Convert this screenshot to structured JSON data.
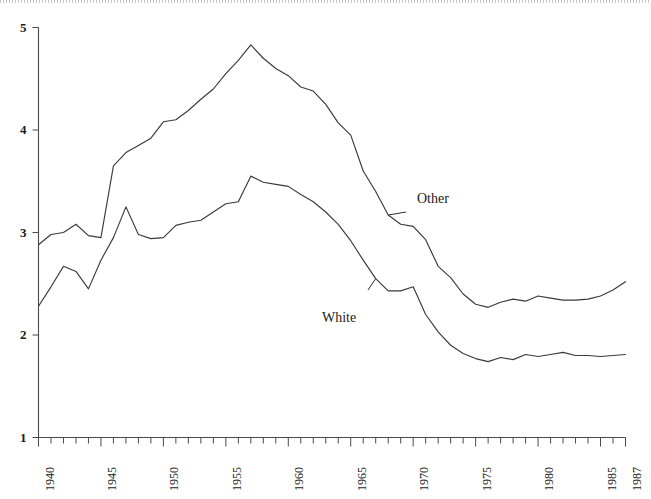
{
  "figure": {
    "background_color": "#ffffff",
    "ink_color": "#3a3a3a",
    "scan_edge_present": true
  },
  "chart_data": {
    "type": "line",
    "title": "",
    "subtitle": "",
    "xlabel": "",
    "ylabel": "",
    "xlim": [
      1940,
      1987
    ],
    "ylim": [
      1,
      5
    ],
    "grid": false,
    "legend_position": "inline-annotations",
    "x_tick_labels": [
      "1940",
      "1945",
      "1950",
      "1955",
      "1960",
      "1965",
      "1970",
      "1975",
      "1980",
      "1985",
      "1987"
    ],
    "x_tick_values": [
      1940,
      1945,
      1950,
      1955,
      1960,
      1965,
      1970,
      1975,
      1980,
      1985,
      1987
    ],
    "x_minor_tick_step": 1,
    "y_tick_labels": [
      "1",
      "2",
      "3",
      "4",
      "5"
    ],
    "y_tick_values": [
      1,
      2,
      3,
      4,
      5
    ],
    "x": [
      1940,
      1941,
      1942,
      1943,
      1944,
      1945,
      1946,
      1947,
      1948,
      1949,
      1950,
      1951,
      1952,
      1953,
      1954,
      1955,
      1956,
      1957,
      1958,
      1959,
      1960,
      1961,
      1962,
      1963,
      1964,
      1965,
      1966,
      1967,
      1968,
      1969,
      1970,
      1971,
      1972,
      1973,
      1974,
      1975,
      1976,
      1977,
      1978,
      1979,
      1980,
      1981,
      1982,
      1983,
      1984,
      1985,
      1986,
      1987
    ],
    "series": [
      {
        "name": "Other",
        "annotation_label": "Other",
        "values": [
          2.88,
          2.98,
          3.0,
          3.08,
          2.97,
          2.95,
          3.65,
          3.78,
          3.85,
          3.92,
          4.08,
          4.1,
          4.19,
          4.3,
          4.4,
          4.55,
          4.68,
          4.83,
          4.7,
          4.6,
          4.53,
          4.42,
          4.38,
          4.25,
          4.07,
          3.95,
          3.6,
          3.4,
          3.17,
          3.08,
          3.06,
          2.93,
          2.67,
          2.56,
          2.4,
          2.3,
          2.27,
          2.32,
          2.35,
          2.33,
          2.38,
          2.36,
          2.34,
          2.34,
          2.35,
          2.38,
          2.44,
          2.52
        ]
      },
      {
        "name": "White",
        "annotation_label": "White",
        "values": [
          2.28,
          2.47,
          2.67,
          2.62,
          2.45,
          2.73,
          2.95,
          3.25,
          2.98,
          2.94,
          2.95,
          3.07,
          3.1,
          3.12,
          3.2,
          3.28,
          3.3,
          3.55,
          3.49,
          3.47,
          3.45,
          3.37,
          3.3,
          3.2,
          3.08,
          2.92,
          2.73,
          2.55,
          2.43,
          2.43,
          2.47,
          2.2,
          2.03,
          1.9,
          1.82,
          1.77,
          1.74,
          1.78,
          1.76,
          1.81,
          1.79,
          1.81,
          1.83,
          1.8,
          1.8,
          1.79,
          1.8,
          1.81
        ]
      }
    ],
    "annotations": [
      {
        "label": "Other",
        "anchor_year": 1968,
        "anchor_value": 3.17
      },
      {
        "label": "White",
        "anchor_year": 1967,
        "anchor_value": 2.55
      }
    ]
  }
}
